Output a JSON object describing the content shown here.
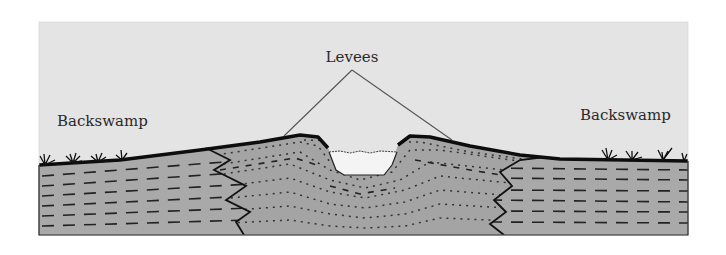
{
  "diagram": {
    "type": "geologic-cross-section",
    "labels": {
      "levees": "Levees",
      "backswamp_left": "Backswamp",
      "backswamp_right": "Backswamp"
    },
    "colors": {
      "sky": "#e4e4e4",
      "sediment": "#a9a9a9",
      "water": "#f4f4f4",
      "outline": "#111111",
      "leader_line": "#555555"
    },
    "elements": [
      {
        "id": "channel",
        "description": "central river channel with water"
      },
      {
        "id": "levee-left",
        "description": "natural levee on left bank (coarse, dotted sediment)"
      },
      {
        "id": "levee-right",
        "description": "natural levee on right bank (coarse, dotted sediment)"
      },
      {
        "id": "backswamp-left",
        "description": "fine-grained backswamp deposits (dashed) with grass tufts"
      },
      {
        "id": "backswamp-right",
        "description": "fine-grained backswamp deposits (dashed) with grass tufts"
      },
      {
        "id": "interfingering-contacts",
        "description": "zig-zag contacts between levee sand and backswamp mud"
      }
    ]
  }
}
